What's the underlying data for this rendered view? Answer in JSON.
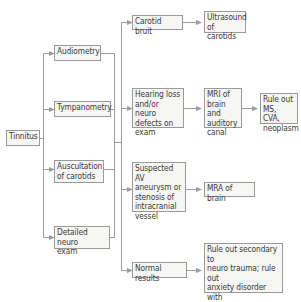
{
  "diagram": {
    "type": "flowchart",
    "colors": {
      "box_border": "#9a9a9a",
      "box_fill": "#f6f6f4",
      "text": "#3a3a3a",
      "connector": "#9c9c9c"
    },
    "nodes": {
      "tinnitus": {
        "label": "Tinnitus"
      },
      "audiometry": {
        "label": "Audiometry"
      },
      "tympanometry": {
        "label": "Tympanometry"
      },
      "auscultation": {
        "label": "Auscultation\nof carotids"
      },
      "neuro_exam": {
        "label": "Detailed neuro\nexam"
      },
      "carotid_bruit": {
        "label": "Carotid bruit"
      },
      "ultrasound": {
        "label": "Ultrasound\nof carotids"
      },
      "hearing_loss": {
        "label": "Hearing loss\nand/or neuro\ndefects on\nexam"
      },
      "mri": {
        "label": "MRI of\nbrain and\nauditory\ncanal"
      },
      "rule_out_ms": {
        "label": "Rule out\nMS, CVA,\nneoplasm"
      },
      "suspected_av": {
        "label": "Suspected AV\naneurysm or\nstenosis of\nintracranial\nvessel"
      },
      "mra": {
        "label": "MRA of brain"
      },
      "normal": {
        "label": "Normal results"
      },
      "rule_out_secondary": {
        "label": "Rule out secondary to\nneuro trauma; rule out\nanxiety disorder with\nsomatization;  rule out\npsychosis"
      }
    },
    "edges": [
      {
        "from": "tinnitus",
        "to": "audiometry"
      },
      {
        "from": "tinnitus",
        "to": "tympanometry"
      },
      {
        "from": "tinnitus",
        "to": "auscultation"
      },
      {
        "from": "tinnitus",
        "to": "neuro_exam"
      },
      {
        "from": "tests",
        "to": "carotid_bruit"
      },
      {
        "from": "tests",
        "to": "hearing_loss"
      },
      {
        "from": "tests",
        "to": "suspected_av"
      },
      {
        "from": "tests",
        "to": "normal"
      },
      {
        "from": "carotid_bruit",
        "to": "ultrasound"
      },
      {
        "from": "hearing_loss",
        "to": "mri"
      },
      {
        "from": "mri",
        "to": "rule_out_ms"
      },
      {
        "from": "suspected_av",
        "to": "mra"
      },
      {
        "from": "normal",
        "to": "rule_out_secondary"
      }
    ]
  }
}
